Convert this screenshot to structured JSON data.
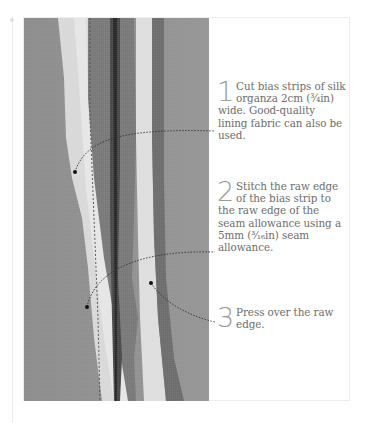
{
  "page": {
    "steps": [
      {
        "number": "1",
        "text": "Cut bias strips of silk organza 2cm (¾in) wide. Good-quality lining fabric can also be used."
      },
      {
        "number": "2",
        "text": "Stitch the raw edge of the bias strip to the raw edge of the seam allowance using a 5mm (³⁄₁₆in) seam allowance."
      },
      {
        "number": "3",
        "text": "Press over the raw edge."
      }
    ],
    "photo": {
      "subject": "close-up of fabric seam with bias strips (grayscale)"
    },
    "colors": {
      "text": "#6e6e6e",
      "number": "#9a9a9a",
      "leader": "#333333",
      "frame": "#eeeeee"
    }
  }
}
